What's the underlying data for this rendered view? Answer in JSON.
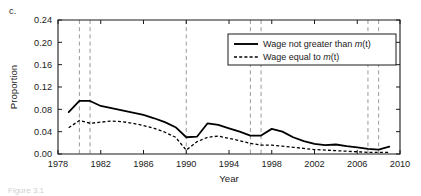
{
  "figure": {
    "panel_label": "c.",
    "caption_fragment": "Figure 3.1"
  },
  "chart_data": {
    "type": "line",
    "title": "",
    "xlabel": "Year",
    "ylabel": "Proportion",
    "xlim": [
      1978,
      2010
    ],
    "ylim": [
      0.0,
      0.24
    ],
    "xticks": [
      1978,
      1982,
      1986,
      1990,
      1994,
      1998,
      2002,
      2006,
      2010
    ],
    "xtick_labels": [
      "1978",
      "1982",
      "1986",
      "1990",
      "1994",
      "1998",
      "2002",
      "2006",
      "2010"
    ],
    "yticks": [
      0.0,
      0.04,
      0.08,
      0.12,
      0.16,
      0.2,
      0.24
    ],
    "ytick_labels": [
      "0.00",
      "0.04",
      "0.08",
      "0.12",
      "0.16",
      "0.20",
      "0.24"
    ],
    "grid": false,
    "legend_position": "upper right",
    "vlines": [
      1980,
      1981,
      1990,
      1996,
      1997,
      2007,
      2008
    ],
    "vline_color": "#9a9a9a",
    "line_color": "#000000",
    "x": [
      1979,
      1980,
      1981,
      1982,
      1983,
      1984,
      1985,
      1986,
      1987,
      1988,
      1989,
      1990,
      1991,
      1992,
      1993,
      1994,
      1995,
      1996,
      1997,
      1998,
      1999,
      2000,
      2001,
      2002,
      2003,
      2004,
      2005,
      2006,
      2007,
      2008,
      2009
    ],
    "series": [
      {
        "name": "Wage not greater than m(t)",
        "style": "solid",
        "values": [
          0.075,
          0.095,
          0.095,
          0.086,
          0.082,
          0.078,
          0.074,
          0.07,
          0.064,
          0.057,
          0.048,
          0.03,
          0.031,
          0.055,
          0.052,
          0.046,
          0.04,
          0.033,
          0.033,
          0.045,
          0.04,
          0.03,
          0.023,
          0.018,
          0.016,
          0.017,
          0.014,
          0.012,
          0.009,
          0.008,
          0.013
        ]
      },
      {
        "name": "Wage equal to m(t)",
        "style": "dashed",
        "values": [
          0.047,
          0.06,
          0.055,
          0.057,
          0.059,
          0.058,
          0.055,
          0.051,
          0.046,
          0.039,
          0.03,
          0.007,
          0.022,
          0.03,
          0.032,
          0.028,
          0.024,
          0.019,
          0.016,
          0.016,
          0.014,
          0.012,
          0.01,
          0.008,
          0.007,
          0.006,
          0.005,
          0.004,
          0.003,
          0.003,
          0.003
        ]
      }
    ]
  },
  "legend": {
    "entries": [
      {
        "label_main": "Wage not greater than ",
        "label_var": "m",
        "label_tail": "(t)",
        "style": "solid"
      },
      {
        "label_main": "Wage equal to ",
        "label_var": "m",
        "label_tail": "(t)",
        "style": "dashed"
      }
    ]
  }
}
